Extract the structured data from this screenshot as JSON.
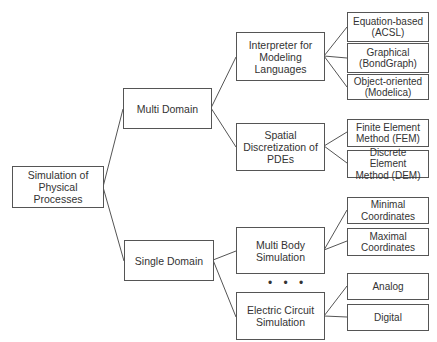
{
  "diagram": {
    "root": "Simulation of\nPhysical Processes",
    "domains": [
      {
        "label": "Multi Domain",
        "children": [
          {
            "label": "Interpreter for\nModeling\nLanguages",
            "children": [
              "Equation-based\n(ACSL)",
              "Graphical\n(BondGraph)",
              "Object-oriented\n(Modelica)"
            ]
          },
          {
            "label": "Spatial\nDiscretization of\nPDEs",
            "children": [
              "Finite Element\nMethod (FEM)",
              "Discrete Element\nMethod (DEM)"
            ]
          }
        ]
      },
      {
        "label": "Single Domain",
        "children": [
          {
            "label": "Multi Body\nSimulation",
            "children": [
              "Minimal\nCoordinates",
              "Maximal\nCoordinates"
            ]
          },
          {
            "label": "Electric Circuit\nSimulation",
            "children": [
              "Analog",
              "Digital"
            ]
          }
        ]
      }
    ],
    "ellipsis": "• • •"
  }
}
